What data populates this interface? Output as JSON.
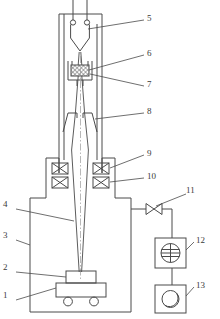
{
  "figure": {
    "type": "technical-line-diagram",
    "width": 220,
    "height": 319,
    "background_color": "#ffffff",
    "line_color": "#4a4a4a",
    "label_color": "#3a3a3a"
  },
  "callouts": [
    {
      "id": "1",
      "number": "1",
      "name": "work-table",
      "x": 6,
      "y": 296,
      "side": "left"
    },
    {
      "id": "2",
      "number": "2",
      "name": "workpiece",
      "x": 6,
      "y": 268,
      "side": "left"
    },
    {
      "id": "3",
      "number": "3",
      "name": "vacuum-chamber",
      "x": 6,
      "y": 236,
      "side": "left"
    },
    {
      "id": "4",
      "number": "4",
      "name": "electron-beam",
      "x": 6,
      "y": 205,
      "side": "left"
    },
    {
      "id": "5",
      "number": "5",
      "name": "cathode-filament",
      "x": 146,
      "y": 16,
      "side": "right"
    },
    {
      "id": "6",
      "number": "6",
      "name": "anode-target",
      "x": 146,
      "y": 51,
      "side": "right"
    },
    {
      "id": "7",
      "number": "7",
      "name": "anode-holder",
      "x": 146,
      "y": 82,
      "side": "right"
    },
    {
      "id": "8",
      "number": "8",
      "name": "beam-aperture",
      "x": 146,
      "y": 109,
      "side": "right"
    },
    {
      "id": "9",
      "number": "9",
      "name": "upper-focus-coil",
      "x": 146,
      "y": 151,
      "side": "right"
    },
    {
      "id": "10",
      "number": "10",
      "name": "lower-focus-coil",
      "x": 146,
      "y": 174,
      "side": "right"
    },
    {
      "id": "11",
      "number": "11",
      "name": "vacuum-valve",
      "x": 186,
      "y": 188,
      "side": "right"
    },
    {
      "id": "12",
      "number": "12",
      "name": "vacuum-gauge",
      "x": 196,
      "y": 238,
      "side": "right"
    },
    {
      "id": "13",
      "number": "13",
      "name": "vacuum-pump",
      "x": 196,
      "y": 283,
      "side": "right"
    }
  ],
  "components": {
    "gun_column": {
      "name": "electron-gun-column"
    },
    "filament": {
      "name": "v-filament-cathode"
    },
    "anode": {
      "name": "hatched-anode-block"
    },
    "aperture": {
      "name": "beam-limiting-aperture"
    },
    "coils": {
      "name": "magnetic-focusing-coils",
      "count": 4
    },
    "beam": {
      "name": "electron-beam-path"
    },
    "chamber": {
      "name": "work-vacuum-chamber"
    },
    "table": {
      "name": "movable-work-table",
      "wheels": 2
    },
    "valve": {
      "name": "gate-valve-symbol"
    },
    "gauge": {
      "name": "vacuum-gauge-symbol"
    },
    "pump": {
      "name": "vacuum-pump-symbol"
    }
  }
}
